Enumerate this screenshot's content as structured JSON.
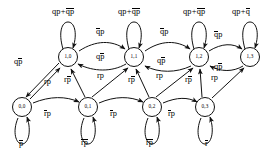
{
  "diagram": {
    "kind": "state-transition-diagram",
    "type": "finite-state-machine",
    "width": 273,
    "height": 157,
    "stroke_color": "#111111",
    "background_color": "#ffffff",
    "variables": [
      "q",
      "p",
      "r"
    ],
    "overline_meaning": "logical negation (bar)",
    "states": [
      {
        "id": "s10",
        "label": "1,0",
        "row": "top",
        "col": 0,
        "x": 68,
        "y": 57
      },
      {
        "id": "s11",
        "label": "1,1",
        "row": "top",
        "col": 1,
        "x": 134,
        "y": 57
      },
      {
        "id": "s12",
        "label": "1,2",
        "row": "top",
        "col": 2,
        "x": 199,
        "y": 57
      },
      {
        "id": "s13",
        "label": "1,3",
        "row": "top",
        "col": 3,
        "x": 250,
        "y": 57
      },
      {
        "id": "s00",
        "label": "0,0",
        "row": "bottom",
        "col": 0,
        "x": 22,
        "y": 107
      },
      {
        "id": "s01",
        "label": "0,1",
        "row": "bottom",
        "col": 1,
        "x": 88,
        "y": 107
      },
      {
        "id": "s02",
        "label": "0,2",
        "row": "bottom",
        "col": 2,
        "x": 152,
        "y": 107
      },
      {
        "id": "s03",
        "label": "0,3",
        "row": "bottom",
        "col": 3,
        "x": 205,
        "y": 107
      }
    ],
    "top_self_loops": [
      {
        "over": "s10",
        "label": "qp+q̄p̄",
        "x": 52,
        "y": 8
      },
      {
        "over": "s11",
        "label": "qp+q̄p̄",
        "x": 118,
        "y": 8
      },
      {
        "over": "s12",
        "label": "qp+q̄p̄",
        "x": 183,
        "y": 8
      },
      {
        "over": "s13",
        "label": "qp+q̄",
        "x": 232,
        "y": 8
      }
    ],
    "bottom_self_loops": [
      {
        "over": "s00",
        "label": "p̄",
        "x": 19,
        "y": 140
      },
      {
        "over": "s01",
        "label": "r̄p̄",
        "x": 81,
        "y": 139
      },
      {
        "over": "s02",
        "label": "r̄p̄",
        "x": 146,
        "y": 139
      },
      {
        "over": "s03",
        "label": "r̄",
        "x": 205,
        "y": 140
      }
    ],
    "top_forward_labels": [
      {
        "from": "s10",
        "to": "s11",
        "label": "q̄p",
        "x": 96,
        "y": 28
      },
      {
        "from": "s11",
        "to": "s12",
        "label": "q̄p",
        "x": 160,
        "y": 28
      },
      {
        "from": "s12",
        "to": "s13",
        "label": "q̄p",
        "x": 214,
        "y": 31
      }
    ],
    "top_return_labels": [
      {
        "from": "s11",
        "to": "s10",
        "label": "qp̄",
        "x": 96,
        "y": 53
      },
      {
        "from": "s12",
        "to": "s11",
        "label": "qp̄",
        "x": 157,
        "y": 57
      },
      {
        "from": "s13",
        "to": "s12",
        "label": "qp̄",
        "x": 214,
        "y": 63
      }
    ],
    "bottom_forward_labels": [
      {
        "from": "s00",
        "to": "s01",
        "label": "r̄p",
        "x": 44,
        "y": 110
      },
      {
        "from": "s01",
        "to": "s02",
        "label": "r̄p",
        "x": 110,
        "y": 110
      },
      {
        "from": "s02",
        "to": "s03",
        "label": "r̄p",
        "x": 168,
        "y": 110
      }
    ],
    "diagonal_up_labels": [
      {
        "from": "s00",
        "to": "s10",
        "label": "rp",
        "x": 44,
        "y": 78
      },
      {
        "from": "s01",
        "to": "s10",
        "label": "rp̄",
        "x": 64,
        "y": 76
      },
      {
        "from": "s01",
        "to": "s11",
        "label": "rp",
        "x": 97,
        "y": 72
      },
      {
        "from": "s02",
        "to": "s11",
        "label": "rp̄",
        "x": 128,
        "y": 76
      },
      {
        "from": "s02",
        "to": "s12",
        "label": "rp",
        "x": 156,
        "y": 72
      },
      {
        "from": "s03",
        "to": "s12",
        "label": "rp̄",
        "x": 185,
        "y": 76
      },
      {
        "from": "s03",
        "to": "s13",
        "label": "rp",
        "x": 211,
        "y": 74
      }
    ],
    "diagonal_down_labels": [
      {
        "from": "s10",
        "to": "s00",
        "label": "qp̄",
        "x": 14,
        "y": 58
      }
    ]
  }
}
